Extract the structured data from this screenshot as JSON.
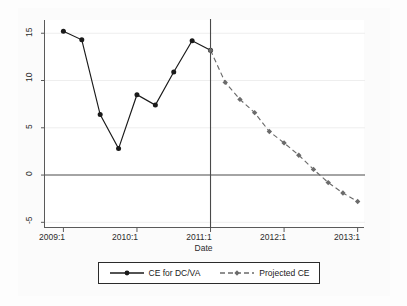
{
  "chart_data": {
    "type": "line",
    "title": "",
    "xlabel": "Date",
    "ylabel": "",
    "x": [
      "2009:1",
      "2009:2",
      "2009:3",
      "2009:4",
      "2010:1",
      "2010:2",
      "2010:3",
      "2010:4",
      "2011:1",
      "2011:2",
      "2011:3",
      "2011:4",
      "2012:1",
      "2012:2",
      "2012:3",
      "2012:4",
      "2013:1"
    ],
    "xtick_labels": [
      "2009:1",
      "2010:1",
      "2011:1",
      "2012:1",
      "2013:1"
    ],
    "xtick_values": [
      2009.0,
      2010.0,
      2011.0,
      2012.0,
      2013.0
    ],
    "ytick_labels": [
      "15",
      "10",
      "5",
      "0",
      "-5"
    ],
    "ytick_values": [
      15,
      10,
      5,
      0,
      -5
    ],
    "xlim": [
      2008.75,
      2013.1
    ],
    "ylim": [
      -5.6,
      16.4
    ],
    "grid": true,
    "legend_position": "below",
    "annotations": [
      {
        "type": "vline",
        "x": 2011.0,
        "label": "2011:1 reference line",
        "color": "#4a4a4a"
      },
      {
        "type": "hline",
        "y": 0,
        "label": "zero line",
        "color": "#4a4a4a"
      }
    ],
    "series": [
      {
        "name": "CE for DC/VA",
        "style": "solid",
        "color": "#1a1a1a",
        "marker": "circle",
        "x": [
          2009.0,
          2009.25,
          2009.5,
          2009.75,
          2010.0,
          2010.25,
          2010.5,
          2010.75,
          2011.0
        ],
        "values": [
          15.2,
          14.3,
          6.4,
          2.8,
          8.5,
          7.4,
          10.9,
          14.2,
          13.2
        ]
      },
      {
        "name": "Projected CE",
        "style": "dashed",
        "color": "#6b6b6b",
        "marker": "diamond",
        "x": [
          2011.0,
          2011.2,
          2011.4,
          2011.6,
          2011.8,
          2012.0,
          2012.2,
          2012.4,
          2012.6,
          2012.8,
          2013.0
        ],
        "values": [
          13.2,
          9.8,
          8.0,
          6.6,
          4.6,
          3.4,
          2.1,
          0.6,
          -0.8,
          -1.9,
          -2.8
        ]
      }
    ]
  },
  "legend": {
    "entries": [
      {
        "label": "CE for DC/VA",
        "style": "solid",
        "color": "#1a1a1a"
      },
      {
        "label": "Projected CE",
        "style": "dashed",
        "color": "#6b6b6b"
      }
    ]
  },
  "axes": {
    "x_title": "Date"
  }
}
